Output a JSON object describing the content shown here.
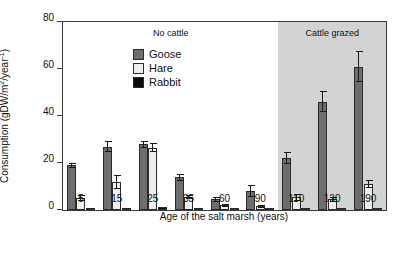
{
  "chart_data": {
    "type": "bar",
    "title": "",
    "xlabel": "Age of the salt marsh (years)",
    "ylabel": "Consumption (gDW/m2/year-1)",
    "ylabel_parts": {
      "pre": "Consumption (gDW/m",
      "sup1": "2",
      "mid": "/year",
      "sup2": "-1",
      "post": ")"
    },
    "categories": [
      "5",
      "15",
      "25",
      "35",
      "60",
      "90",
      "110",
      "130",
      "190"
    ],
    "ylim": [
      0,
      80
    ],
    "yticks": [
      0,
      20,
      40,
      60,
      80
    ],
    "ytick_labels": [
      "0",
      "20",
      "40",
      "60",
      "80"
    ],
    "grid": false,
    "legend_position": "top-left",
    "series": [
      {
        "name": "Goose",
        "color": "#6e6e6e",
        "values": [
          19,
          27,
          28,
          14,
          4.5,
          8,
          22,
          46,
          61
        ],
        "errors": [
          1.2,
          2.5,
          1.5,
          1.5,
          1.2,
          2.5,
          2.5,
          4.5,
          6.5
        ]
      },
      {
        "name": "Hare",
        "color": "#eeeeee",
        "values": [
          5,
          12,
          26.5,
          5.5,
          2,
          1.5,
          5.5,
          4.5,
          11
        ],
        "errors": [
          1.2,
          3.0,
          2.0,
          1.0,
          0.6,
          0.6,
          1.5,
          1.0,
          1.8
        ]
      },
      {
        "name": "Rabbit",
        "color": "#0b0b0b",
        "values": [
          0.3,
          1.0,
          1.2,
          0.2,
          0.2,
          0.2,
          0.2,
          0.2,
          0.6
        ],
        "errors": [
          0,
          0,
          0,
          0,
          0,
          0,
          0,
          0,
          0
        ]
      }
    ],
    "annotations": [
      {
        "label": "No cattle",
        "at_category_span": [
          "5",
          "90"
        ]
      },
      {
        "label": "Cattle grazed",
        "at_category_span": [
          "110",
          "190"
        ]
      }
    ],
    "shaded_region": {
      "label": "Cattle grazed",
      "from_category": "110",
      "to_category": "190",
      "color": "#d3d3d3"
    }
  },
  "legend": {
    "items": [
      {
        "label": "Goose"
      },
      {
        "label": "Hare"
      },
      {
        "label": "Rabbit"
      }
    ]
  }
}
